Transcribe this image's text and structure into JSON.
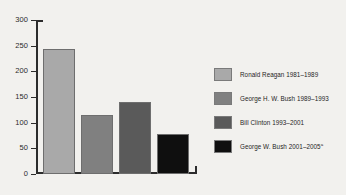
{
  "chart_data": {
    "type": "bar",
    "title": "",
    "subtitle": "",
    "xlabel": "",
    "ylabel": "",
    "categories": [
      "Ronald Reagan 1981–1989",
      "George H. W. Bush 1989–1993",
      "Bill Clinton 1993–2001",
      "George W. Bush 2001–2005"
    ],
    "values": [
      243,
      114,
      141,
      77
    ],
    "colors": [
      "#a9a9a9",
      "#808080",
      "#5a5a5a",
      "#0f0f0f"
    ],
    "ylim": [
      0,
      300
    ],
    "yticks": [
      0,
      50,
      100,
      150,
      200,
      250,
      300
    ],
    "ytick_labels": [
      "0",
      "50",
      "100",
      "150",
      "200",
      "250",
      "300"
    ],
    "grid": false,
    "legend_position": "right",
    "legend": [
      {
        "label": "Ronald Reagan 1981–1989",
        "sup": "",
        "color": "#a9a9a9"
      },
      {
        "label": "George H. W. Bush 1989–1993",
        "sup": "",
        "color": "#808080"
      },
      {
        "label": "Bill Clinton 1993–2001",
        "sup": "",
        "color": "#5a5a5a"
      },
      {
        "label": "George W. Bush 2001–2005",
        "sup": "a",
        "color": "#0f0f0f"
      }
    ]
  },
  "axis": {
    "ytick_0": "0",
    "ytick_1": "50",
    "ytick_2": "100",
    "ytick_3": "150",
    "ytick_4": "200",
    "ytick_5": "250",
    "ytick_6": "300"
  },
  "legend": {
    "item_0_label": "Ronald Reagan 1981–1989",
    "item_1_label": "George H. W. Bush 1989–1993",
    "item_2_label": "Bill Clinton 1993–2001",
    "item_3_label": "George W. Bush 2001–2005",
    "item_3_sup": "a"
  },
  "theme": {
    "background": "#f2f1ee",
    "axis_color": "#2c2c2c",
    "text_color": "#1e1e1e"
  }
}
